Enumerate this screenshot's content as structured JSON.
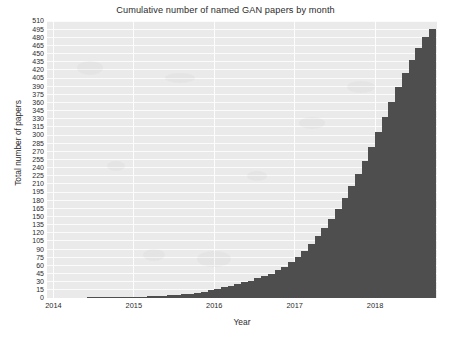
{
  "chart_data": {
    "type": "bar",
    "title": "Cumulative number of named GAN papers by month",
    "xlabel": "Year",
    "ylabel": "Total number of papers",
    "grid": true,
    "legend": null,
    "bar_color": "#4e4e4e",
    "plot_background": "#eaeaea",
    "gridline_color": "#fbfbfb",
    "ylim": [
      0,
      510
    ],
    "ytick_step": 15,
    "yticks": [
      0,
      15,
      30,
      45,
      60,
      75,
      90,
      105,
      120,
      135,
      150,
      165,
      180,
      195,
      210,
      225,
      240,
      255,
      270,
      285,
      300,
      315,
      330,
      345,
      360,
      375,
      390,
      405,
      420,
      435,
      450,
      465,
      480,
      495,
      510
    ],
    "xticks": [
      "2014",
      "2015",
      "2016",
      "2017",
      "2018"
    ],
    "xtick_positions_year": [
      2014,
      2015,
      2016,
      2017,
      2018
    ],
    "xlim_year": [
      2013.92,
      2018.77
    ],
    "x_months": [
      "2014-01",
      "2014-02",
      "2014-03",
      "2014-04",
      "2014-05",
      "2014-06",
      "2014-07",
      "2014-08",
      "2014-09",
      "2014-10",
      "2014-11",
      "2014-12",
      "2015-01",
      "2015-02",
      "2015-03",
      "2015-04",
      "2015-05",
      "2015-06",
      "2015-07",
      "2015-08",
      "2015-09",
      "2015-10",
      "2015-11",
      "2015-12",
      "2016-01",
      "2016-02",
      "2016-03",
      "2016-04",
      "2016-05",
      "2016-06",
      "2016-07",
      "2016-08",
      "2016-09",
      "2016-10",
      "2016-11",
      "2016-12",
      "2017-01",
      "2017-02",
      "2017-03",
      "2017-04",
      "2017-05",
      "2017-06",
      "2017-07",
      "2017-08",
      "2017-09",
      "2017-10",
      "2017-11",
      "2017-12",
      "2018-01",
      "2018-02",
      "2018-03",
      "2018-04",
      "2018-05",
      "2018-06",
      "2018-07",
      "2018-08",
      "2018-09"
    ],
    "values": [
      0,
      0,
      0,
      0,
      0,
      1,
      1,
      1,
      1,
      1,
      2,
      2,
      2,
      2,
      3,
      3,
      4,
      5,
      6,
      7,
      8,
      9,
      11,
      14,
      17,
      20,
      23,
      26,
      29,
      32,
      36,
      40,
      45,
      51,
      58,
      66,
      76,
      87,
      100,
      114,
      129,
      146,
      164,
      184,
      206,
      229,
      253,
      278,
      305,
      333,
      360,
      388,
      414,
      438,
      460,
      480,
      495
    ]
  }
}
